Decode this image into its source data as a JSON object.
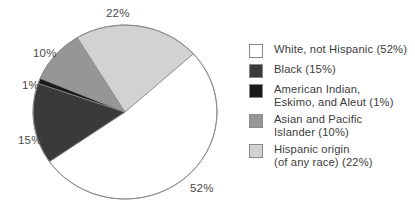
{
  "chart_data": {
    "type": "pie",
    "title": "",
    "categories": [
      "White, not Hispanic",
      "Black",
      "American Indian, Eskimo, and Aleut",
      "Asian and Pacific Islander",
      "Hispanic origin (of any race)"
    ],
    "values": [
      52,
      15,
      1,
      10,
      22
    ],
    "unit": "%",
    "colors": [
      "#ffffff",
      "#3a3a3a",
      "#1a1a1a",
      "#969696",
      "#d2d2d2"
    ],
    "outline_color": "#8a8a8a",
    "legend_position": "right",
    "grid": false,
    "start_angle_deg": 48,
    "direction": "clockwise"
  },
  "pie": {
    "center_x": 125,
    "center_y": 112,
    "radius_x": 92,
    "radius_y": 87,
    "slice_labels": [
      {
        "text": "22%",
        "x": 106,
        "y": 8
      },
      {
        "text": "10%",
        "x": 33,
        "y": 48
      },
      {
        "text": "1%",
        "x": 22,
        "y": 80
      },
      {
        "text": "15%",
        "x": 18,
        "y": 135
      },
      {
        "text": "52%",
        "x": 190,
        "y": 183
      }
    ]
  },
  "legend": {
    "items": [
      {
        "swatch": "#ffffff",
        "line1": "White, not Hispanic (52%)",
        "line2": ""
      },
      {
        "swatch": "#3a3a3a",
        "line1": "Black (15%)",
        "line2": ""
      },
      {
        "swatch": "#1a1a1a",
        "line1": "American Indian,",
        "line2": "Eskimo, and Aleut (1%)"
      },
      {
        "swatch": "#969696",
        "line1": "Asian and Pacific",
        "line2": "Islander (10%)"
      },
      {
        "swatch": "#d2d2d2",
        "line1": "Hispanic origin",
        "line2": "(of any race) (22%)"
      }
    ]
  }
}
